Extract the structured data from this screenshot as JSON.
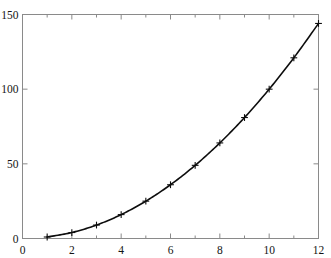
{
  "chart_data": {
    "type": "line",
    "title": "",
    "subtitle": "",
    "xlabel": "",
    "ylabel": "",
    "x": [
      1,
      2,
      3,
      4,
      5,
      6,
      7,
      8,
      9,
      10,
      11,
      12
    ],
    "values": [
      1,
      4,
      9,
      16,
      25,
      36,
      49,
      64,
      81,
      100,
      121,
      144
    ],
    "series": [
      {
        "name": "",
        "x": [
          1,
          2,
          3,
          4,
          5,
          6,
          7,
          8,
          9,
          10,
          11,
          12
        ],
        "values": [
          1,
          4,
          9,
          16,
          25,
          36,
          49,
          64,
          81,
          100,
          121,
          144
        ],
        "marker": "plus",
        "color": "#000000"
      }
    ],
    "xlim": [
      0,
      12
    ],
    "ylim": [
      0,
      150
    ],
    "xticks": [
      0,
      2,
      4,
      6,
      8,
      10,
      12
    ],
    "xtick_labels": [
      "0",
      "2",
      "4",
      "6",
      "8",
      "10",
      "12"
    ],
    "yticks": [
      0,
      50,
      100,
      150
    ],
    "ytick_labels": [
      "0",
      "50",
      "100",
      "150"
    ],
    "x_minor_ticks": [
      1,
      3,
      5,
      7,
      9,
      11
    ],
    "grid": false,
    "legend": null,
    "frame": {
      "box": true,
      "ticks_on_all_sides": true,
      "tick_direction": "in"
    }
  },
  "axes": {
    "y_tick_labels": [
      "150",
      "100",
      "50",
      "0"
    ],
    "x_tick_labels": [
      "0",
      "2",
      "4",
      "6",
      "8",
      "10",
      "12"
    ]
  },
  "colors": {
    "curve": "#0d0d0d",
    "frame": "#8a8a8a",
    "tick_text": "#141414",
    "background": "#ffffff"
  }
}
